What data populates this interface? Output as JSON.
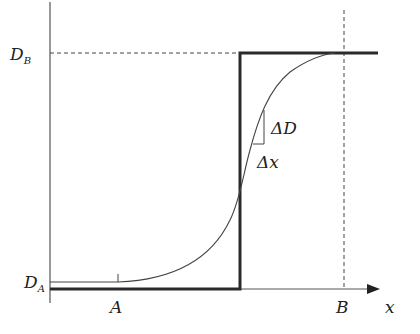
{
  "diagram": {
    "type": "step-vs-smooth-profile",
    "axes": {
      "x_label": "x",
      "y_tick_labels": [
        {
          "main": "D",
          "sub": "B",
          "level": "top"
        },
        {
          "main": "D",
          "sub": "A",
          "level": "bottom"
        }
      ],
      "x_tick_labels": [
        {
          "text": "A",
          "position": "left"
        },
        {
          "text": "B",
          "position": "right"
        }
      ]
    },
    "annotations": {
      "delta_d": "ΔD",
      "delta_x": "Δx"
    },
    "curves": [
      {
        "name": "step-function",
        "style": "thick"
      },
      {
        "name": "smooth-sigmoid",
        "style": "thin"
      }
    ],
    "guides": [
      {
        "name": "DB-dashed-horizontal",
        "style": "dashed"
      },
      {
        "name": "B-dashed-vertical",
        "style": "dashed"
      }
    ],
    "colors": {
      "line": "#333333",
      "thick_line": "#2a2a2a",
      "background": "#ffffff"
    }
  }
}
